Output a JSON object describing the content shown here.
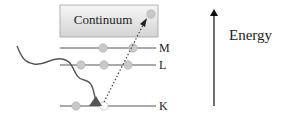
{
  "continuum": {
    "label": "Continuum"
  },
  "shells": [
    {
      "name": "M",
      "label": "M"
    },
    {
      "name": "L",
      "label": "L"
    },
    {
      "name": "K",
      "label": "K"
    }
  ],
  "energy_axis": {
    "label": "Energy"
  },
  "colors": {
    "electron": "#c8c8c8",
    "electron_stroke": "#a8a8a8",
    "line": "#555555",
    "photon": "#555555",
    "triangle": "#555555",
    "box_top": "#f4f4f4",
    "box_bottom": "#d6d6d6",
    "box_border": "#9a9a9a"
  }
}
